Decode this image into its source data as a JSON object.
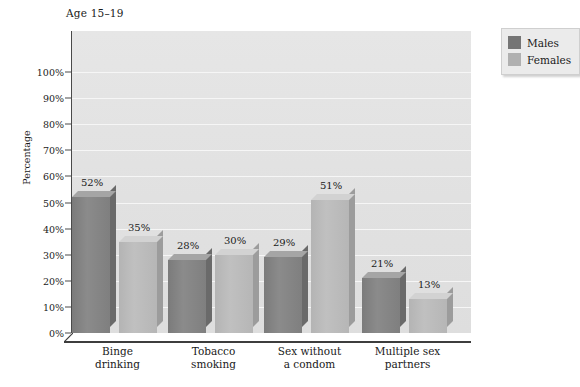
{
  "chart_data": {
    "type": "bar",
    "title": "",
    "subtitle": "Age 15–19",
    "xlabel": "",
    "ylabel": "Percentage",
    "ylim": [
      0,
      110
    ],
    "grid": true,
    "legend_position": "top-right",
    "categories": [
      "Binge\ndrinking",
      "Tobacco\nsmoking",
      "Sex without\na condom",
      "Multiple sex\npartners"
    ],
    "series": [
      {
        "name": "Males",
        "color": "#7f7f7f",
        "values": [
          52,
          28,
          29,
          21
        ],
        "value_labels": [
          "52%",
          "28%",
          "29%",
          "21%"
        ]
      },
      {
        "name": "Females",
        "color": "#b8b8b8",
        "values": [
          35,
          30,
          51,
          13
        ],
        "value_labels": [
          "35%",
          "30%",
          "51%",
          "13%"
        ]
      }
    ],
    "y_ticks": [
      0,
      10,
      20,
      30,
      40,
      50,
      60,
      70,
      80,
      90,
      100
    ],
    "y_tick_labels": [
      "0%",
      "10%",
      "20%",
      "30%",
      "40%",
      "50%",
      "60%",
      "70%",
      "80%",
      "90%",
      "100%"
    ]
  },
  "legend": {
    "items": [
      {
        "label": "Males",
        "color": "#757575"
      },
      {
        "label": "Females",
        "color": "#b0b0b0"
      }
    ]
  }
}
